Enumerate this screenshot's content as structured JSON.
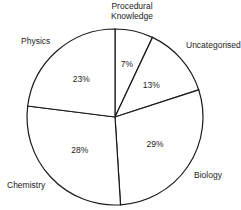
{
  "chart_data": {
    "type": "pie",
    "title": "",
    "start": "top",
    "direction": "clockwise",
    "slices": [
      {
        "label": "Procedural Knowledge",
        "label_lines": [
          "Procedural",
          "Knowledge"
        ],
        "value": 7,
        "value_label": "7%"
      },
      {
        "label": "Uncategorised",
        "label_lines": [
          "Uncategorised"
        ],
        "value": 13,
        "value_label": "13%"
      },
      {
        "label": "Biology",
        "label_lines": [
          "Biology"
        ],
        "value": 29,
        "value_label": "29%"
      },
      {
        "label": "Chemistry",
        "label_lines": [
          "Chemistry"
        ],
        "value": 28,
        "value_label": "28%"
      },
      {
        "label": "Physics",
        "label_lines": [
          "Physics"
        ],
        "value": 23,
        "value_label": "23%"
      }
    ],
    "colors": {
      "fill": "#ffffff",
      "stroke": "#1a1a1a",
      "text": "#222222"
    }
  }
}
